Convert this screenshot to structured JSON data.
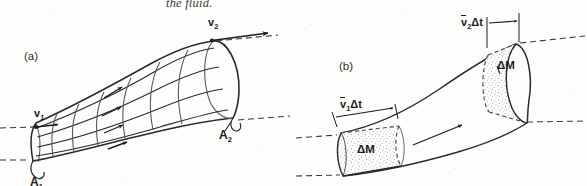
{
  "figure": {
    "caption_fragment": "the fluid.",
    "panel_a": {
      "label": "(a)",
      "velocity_in": "v",
      "velocity_in_sub": "1",
      "velocity_out": "v",
      "velocity_out_sub": "2",
      "area_in": "A",
      "area_in_sub": "1",
      "area_out": "A",
      "area_out_sub": "2",
      "streamline_count": 4,
      "ring_count": 6
    },
    "panel_b": {
      "label": "(b)",
      "slab_in_thickness": "Δt",
      "slab_in_velocity": "v",
      "slab_in_velocity_sub": "1",
      "slab_out_thickness": "Δt",
      "slab_out_velocity": "v",
      "slab_out_velocity_sub": "2",
      "mass_in": "ΔM",
      "mass_out": "ΔM"
    },
    "colors": {
      "ink": "#1d1c1b",
      "line": "#2b2a28",
      "light_line": "#5a5855",
      "paper": "#fdfdfc",
      "stipple": "#7b7975",
      "dash": "#3a3937"
    }
  }
}
